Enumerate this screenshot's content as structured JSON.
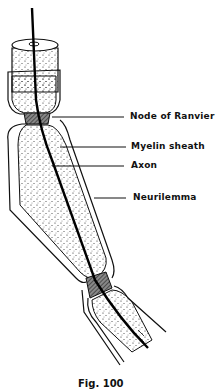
{
  "figure": {
    "caption": "Fig. 100"
  },
  "labels": [
    {
      "text": "Node of Ranvier"
    },
    {
      "text": "Myelin sheath"
    },
    {
      "text": "Axon"
    },
    {
      "text": "Neurilemma"
    }
  ],
  "colors": {
    "line": "#111111",
    "node_fill": "#555555",
    "background": "#ffffff"
  }
}
